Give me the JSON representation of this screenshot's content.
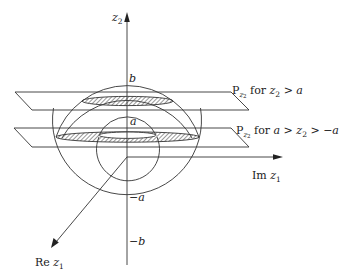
{
  "diagram": {
    "axes": {
      "vertical": {
        "name": "z",
        "sub": "2"
      },
      "horizontal": {
        "name": "Im ",
        "var": "z",
        "sub": "1"
      },
      "diagonal": {
        "name": "Re ",
        "var": "z",
        "sub": "1"
      }
    },
    "tick_labels": {
      "b": "b",
      "a": "a",
      "neg_a": "−a",
      "neg_b": "−b"
    },
    "planes": [
      {
        "P": "P",
        "sub": "z",
        "subsub": "2",
        "text_for": " for ",
        "cond_var": "z",
        "cond_sub": "2",
        "cond_rest": " > a"
      },
      {
        "P": "P",
        "sub": "z",
        "subsub": "2",
        "text_for": " for ",
        "cond_pre": "a > ",
        "cond_var": "z",
        "cond_sub": "2",
        "cond_rest": " > −a"
      }
    ],
    "colors": {
      "line": "#333333",
      "hatch": "#444444",
      "background": "#ffffff"
    }
  }
}
